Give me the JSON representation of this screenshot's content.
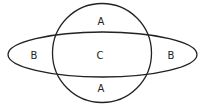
{
  "diagram": {
    "type": "venn",
    "shapes": {
      "circle": {
        "cx": 102,
        "cy": 53,
        "r": 49.5
      },
      "ellipse": {
        "cx": 102.5,
        "cy": 54.5,
        "rx": 94.5,
        "ry": 22.5
      }
    },
    "stroke_color": "#222222",
    "labels": {
      "top": "A",
      "bottom": "A",
      "left": "B",
      "right": "B",
      "center": "C"
    }
  }
}
